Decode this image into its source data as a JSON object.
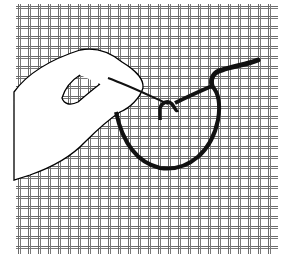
{
  "illustration": {
    "subject": "hand threading yarn through needlepoint canvas",
    "colors": {
      "background": "#ffffff",
      "grid": "#6a6a6a",
      "yarn": "#111111",
      "outline": "#000000"
    }
  }
}
